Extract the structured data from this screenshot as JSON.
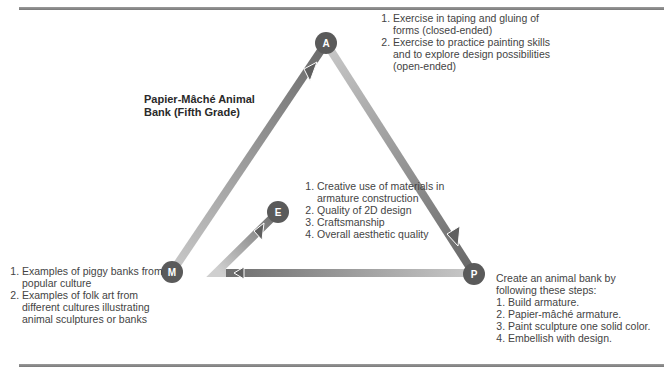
{
  "title": "Papier-Mâché Animal Bank (Fifth Grade)",
  "title_lines": [
    "Papier-Mâché Animal",
    "Bank (Fifth Grade)"
  ],
  "nodes": {
    "A": {
      "label": "A",
      "x": 326,
      "y": 43
    },
    "M": {
      "label": "M",
      "x": 172,
      "y": 272
    },
    "P": {
      "label": "P",
      "x": 474,
      "y": 274
    },
    "E": {
      "label": "E",
      "x": 278,
      "y": 212
    }
  },
  "colors": {
    "node_fill": "#5a5a5a",
    "arrow_dark": "#6a6a6a",
    "arrow_light": "#c8c8c8",
    "rule": "#888888",
    "text": "#444444"
  },
  "blocks": {
    "A": {
      "items": [
        "Exercise in taping and gluing of forms (closed-ended)",
        "Exercise to practice painting skills and to explore design possibilities (open-ended)"
      ]
    },
    "E": {
      "items": [
        "Creative use of materials in armature construction",
        "Quality of 2D design",
        "Craftsmanship",
        "Overall aesthetic quality"
      ]
    },
    "M": {
      "items": [
        "Examples of piggy banks from popular culture",
        "Examples of folk art from different cultures illustrating animal sculptures or banks"
      ]
    },
    "P": {
      "intro": "Create an animal bank by following these steps:",
      "items": [
        "Build armature.",
        "Papier-mâché armature.",
        "Paint sculpture one solid color.",
        "Embellish with design."
      ]
    }
  }
}
